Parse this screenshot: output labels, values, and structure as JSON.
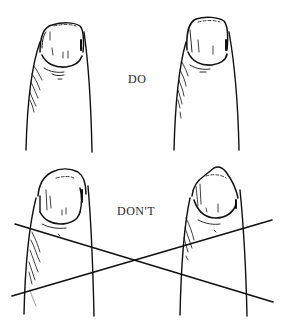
{
  "illustration": {
    "subject": "fingernail care comparison",
    "labels": {
      "do": "DO",
      "dont": "DON'T"
    },
    "panels": [
      {
        "id": "do-left",
        "section": "do",
        "nail_shape": "rounded, trimmed"
      },
      {
        "id": "do-right",
        "section": "do",
        "nail_shape": "rounded, trimmed"
      },
      {
        "id": "dont-left",
        "section": "dont",
        "nail_shape": "long, rounded over tip"
      },
      {
        "id": "dont-right",
        "section": "dont",
        "nail_shape": "pointed"
      }
    ],
    "cross_out": {
      "present": true,
      "color": "#111111"
    },
    "ink_color": "#111111",
    "background": "#ffffff"
  }
}
